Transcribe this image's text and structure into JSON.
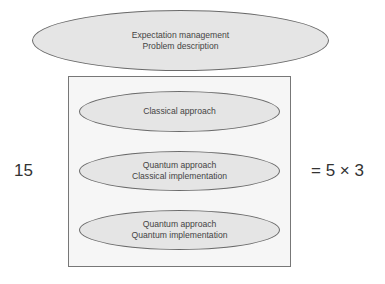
{
  "top_ellipse": {
    "lines": [
      "Expectation management",
      "Problem description"
    ]
  },
  "approaches": [
    {
      "lines": [
        "Classical approach"
      ]
    },
    {
      "lines": [
        "Quantum approach",
        "Classical implementation"
      ]
    },
    {
      "lines": [
        "Quantum approach",
        "Quantum implementation"
      ]
    }
  ],
  "left_label": "15",
  "right_label": "= 5 × 3",
  "colors": {
    "ellipse_fill": "#e5e5e5",
    "box_fill": "#f6f6f6",
    "stroke": "#6a6a6a",
    "text": "#444444"
  }
}
